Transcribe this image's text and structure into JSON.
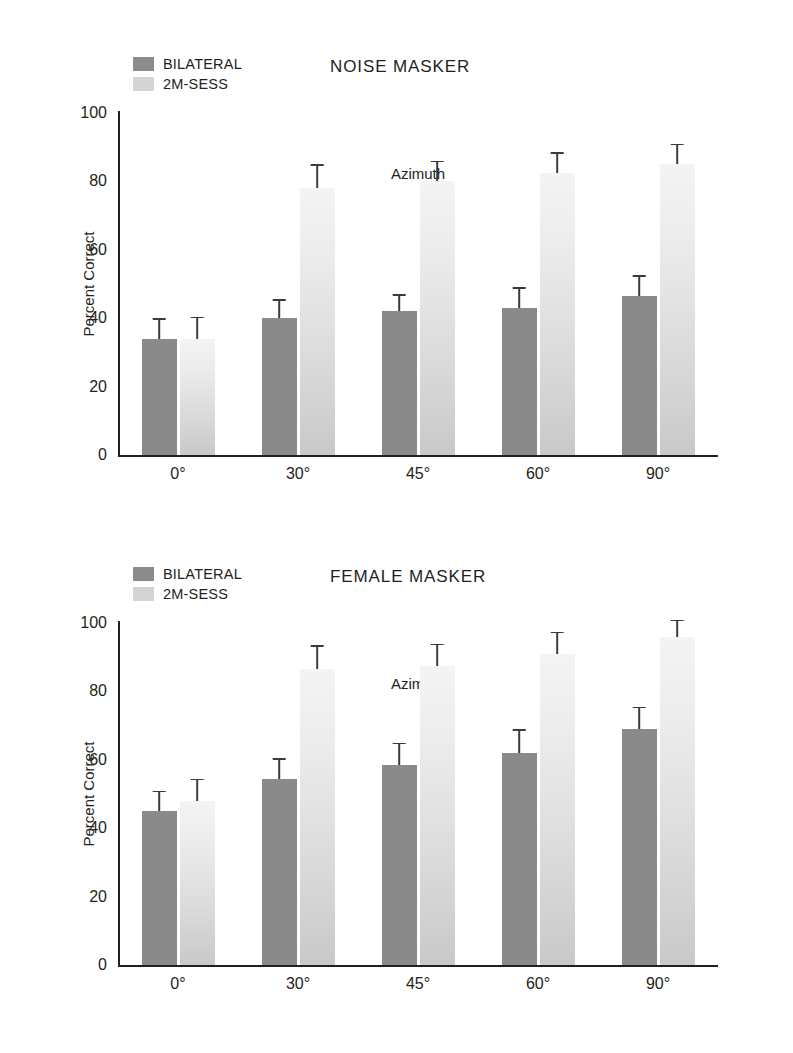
{
  "figure": {
    "legend": {
      "items": [
        {
          "label": "BILATERAL",
          "color": "#8a8a8a",
          "key": "bilateral"
        },
        {
          "label": "2M-SESS",
          "color": "#d4d4d4",
          "key": "2m_sess"
        }
      ]
    }
  },
  "chart_data": [
    {
      "type": "bar",
      "title": "NOISE MASKER",
      "xlabel": "Azimuth",
      "ylabel": "Percent Correct",
      "ylim": [
        0,
        100
      ],
      "yticks": [
        0,
        20,
        40,
        60,
        80,
        100
      ],
      "grid": false,
      "legend_position": "top-left",
      "categories": [
        "0°",
        "30°",
        "45°",
        "60°",
        "90°"
      ],
      "series": [
        {
          "name": "BILATERAL",
          "color": "#8a8a8a",
          "values": [
            34,
            40,
            42,
            43,
            46.5
          ],
          "errors": [
            6,
            5.5,
            5,
            6,
            6
          ]
        },
        {
          "name": "2M-SESS",
          "color": "#d4d4d4",
          "values": [
            34,
            78,
            80,
            82.5,
            85
          ],
          "errors": [
            6.5,
            7,
            6,
            6,
            6
          ]
        }
      ]
    },
    {
      "type": "bar",
      "title": "FEMALE MASKER",
      "xlabel": "Azimuth",
      "ylabel": "Percent Correct",
      "ylim": [
        0,
        100
      ],
      "yticks": [
        0,
        20,
        40,
        60,
        80,
        100
      ],
      "grid": false,
      "legend_position": "top-left",
      "categories": [
        "0°",
        "30°",
        "45°",
        "60°",
        "90°"
      ],
      "series": [
        {
          "name": "BILATERAL",
          "color": "#8a8a8a",
          "values": [
            45,
            54.5,
            58.5,
            62,
            69
          ],
          "errors": [
            6,
            6,
            6.5,
            7,
            6.5
          ]
        },
        {
          "name": "2M-SESS",
          "color": "#d4d4d4",
          "values": [
            48,
            86.5,
            87.5,
            91,
            96
          ],
          "errors": [
            6.5,
            7,
            6.5,
            6.5,
            5
          ]
        }
      ]
    }
  ]
}
